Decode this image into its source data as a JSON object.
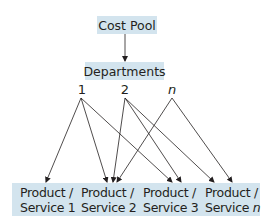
{
  "diagram": {
    "cost_pool": "Cost Pool",
    "departments": "Departments",
    "department_labels": [
      "1",
      "2",
      "n"
    ],
    "products": [
      {
        "line1": "Product /",
        "line2_prefix": "Service ",
        "line2_suffix": "1"
      },
      {
        "line1": "Product /",
        "line2_prefix": "Service ",
        "line2_suffix": "2"
      },
      {
        "line1": "Product /",
        "line2_prefix": "Service ",
        "line2_suffix": "3"
      },
      {
        "line1": "Product /",
        "line2_prefix": "Service ",
        "line2_suffix": "n"
      }
    ],
    "edges": [
      {
        "from": "Cost Pool",
        "to": "Departments"
      },
      {
        "from": "1",
        "to": "Product / Service 1"
      },
      {
        "from": "1",
        "to": "Product / Service 2"
      },
      {
        "from": "1",
        "to": "Product / Service 3"
      },
      {
        "from": "2",
        "to": "Product / Service 2"
      },
      {
        "from": "2",
        "to": "Product / Service 3"
      },
      {
        "from": "2",
        "to": "Product / Service n"
      },
      {
        "from": "n",
        "to": "Product / Service 2"
      },
      {
        "from": "n",
        "to": "Product / Service n"
      }
    ],
    "colors": {
      "box_fill": "#d3e4ee",
      "line": "#231f20"
    }
  }
}
